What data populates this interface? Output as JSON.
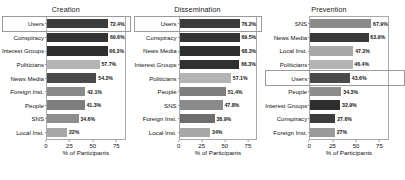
{
  "chart_data": {
    "type": "bar",
    "orientation": "horizontal",
    "title": "",
    "xlabel": "% of Participants",
    "ylabel": "",
    "xlim": [
      0,
      85
    ],
    "xticks": [
      0,
      25,
      50,
      75
    ],
    "grid": false,
    "legend": "none",
    "value_suffix": "%",
    "panels": [
      {
        "title": "Creation",
        "highlight_category": "Users",
        "categories": [
          "Users",
          "Conspiracy",
          "Interest Groups",
          "Politicians",
          "News Media",
          "Foreign Inst.",
          "People",
          "SNS",
          "Local Inst."
        ],
        "values": [
          72.4,
          69.6,
          66.3,
          57.7,
          54.2,
          42.1,
          41.3,
          34.6,
          22.0
        ],
        "labels": [
          "72.4%",
          "69.6%",
          "66.3%",
          "57.7%",
          "54.2%",
          "42.1%",
          "41.3%",
          "34.6%",
          "22%"
        ],
        "colors": [
          "#3c3c3c",
          "#333333",
          "#2e2e2e",
          "#b4b4b4",
          "#4a4a4a",
          "#8a8a8a",
          "#7e7e7e",
          "#8e8e8e",
          "#a8a8a8"
        ]
      },
      {
        "title": "Dissemination",
        "highlight_category": "Users",
        "categories": [
          "Users",
          "Conspiracy",
          "News Media",
          "Interest Groups",
          "Politicians",
          "People",
          "SNS",
          "Foreign Inst.",
          "Local Inst."
        ],
        "values": [
          76.2,
          69.5,
          68.3,
          66.3,
          57.1,
          51.4,
          47.8,
          38.9,
          34.0
        ],
        "labels": [
          "76.2%",
          "69.5%",
          "68.3%",
          "66.3%",
          "57.1%",
          "51.4%",
          "47.8%",
          "38.9%",
          "34%"
        ],
        "colors": [
          "#3c3c3c",
          "#333333",
          "#2e2e2e",
          "#303030",
          "#b4b4b4",
          "#7e7e7e",
          "#8a8a8a",
          "#6e6e6e",
          "#a8a8a8"
        ]
      },
      {
        "title": "Prevention",
        "highlight_category": "Users",
        "categories": [
          "SNS",
          "News Media",
          "Local Inst.",
          "Politicians",
          "Users",
          "People",
          "Interest Groups",
          "Conspiracy",
          "Foreign Inst."
        ],
        "values": [
          67.9,
          63.9,
          47.3,
          46.4,
          43.6,
          34.3,
          32.9,
          27.6,
          27.0
        ],
        "labels": [
          "67.9%",
          "63.9%",
          "47.3%",
          "46.4%",
          "43.6%",
          "34.3%",
          "32.9%",
          "27.6%",
          "27%"
        ],
        "colors": [
          "#8a8a8a",
          "#3a3a3a",
          "#a8a8a8",
          "#b4b4b4",
          "#4a4a4a",
          "#8e8e8e",
          "#2e2e2e",
          "#3c3c3c",
          "#9a9a9a"
        ]
      }
    ]
  }
}
